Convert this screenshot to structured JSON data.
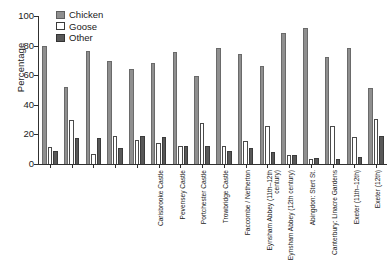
{
  "chart_data": {
    "type": "bar",
    "title": "",
    "xlabel": "",
    "ylabel": "Percentage",
    "ylim": [
      0,
      100
    ],
    "yticks": [
      0,
      20,
      40,
      60,
      80,
      100
    ],
    "grid": false,
    "legend_position": "top-left",
    "categories": [
      "Carisbrooke Castle",
      "Pevensey Castle",
      "Portchester Castle",
      "Trowbridge Castle",
      "Faccombe / Netherton",
      "Eynsham Abbey (11th–12th century)",
      "Eynsham Abbey (12th century)",
      "Abingdon: Stert St.",
      "Canterbury: Linacre Gardens",
      "Exeter (11th–12th)",
      "Exeter (12th)",
      "Winchester W suburbs",
      "Winchester N suburbs",
      "York: Fishergate (12 mm)",
      "York: Fishergate (2 mm)",
      "West Cotton"
    ],
    "series": [
      {
        "name": "Chicken",
        "color": "#8f8f8f",
        "values": [
          79.5,
          52.0,
          76.5,
          69.5,
          64.5,
          68.0,
          76.0,
          59.5,
          78.5,
          74.0,
          66.5,
          88.5,
          92.0,
          72.0,
          78.5,
          51.5
        ]
      },
      {
        "name": "Goose",
        "color": "#ffffff",
        "values": [
          11.5,
          30.0,
          7.0,
          19.0,
          16.5,
          14.0,
          12.0,
          28.0,
          12.0,
          15.5,
          25.5,
          6.0,
          3.5,
          26.0,
          18.0,
          30.5
        ]
      },
      {
        "name": "Other",
        "color": "#585858",
        "values": [
          8.5,
          17.5,
          17.5,
          11.0,
          19.0,
          18.5,
          12.0,
          12.0,
          9.0,
          11.0,
          8.0,
          6.0,
          4.0,
          3.5,
          4.5,
          19.0
        ]
      }
    ]
  },
  "axis": {
    "y_title": "Percentage",
    "y_tick_labels": [
      "0",
      "20",
      "40",
      "60",
      "80",
      "100"
    ]
  },
  "legend": {
    "items": [
      {
        "label": "Chicken",
        "key": "chicken"
      },
      {
        "label": "Goose",
        "key": "goose"
      },
      {
        "label": "Other",
        "key": "other"
      }
    ]
  }
}
